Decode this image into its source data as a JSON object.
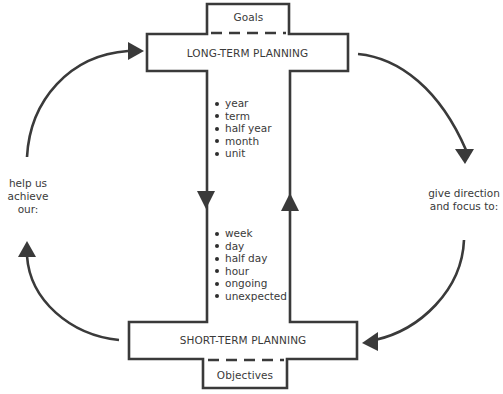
{
  "diagram": {
    "colors": {
      "stroke": "#3a3a3a",
      "text": "#3a3a3a",
      "background": "#ffffff"
    },
    "long_term": {
      "title": "LONG-TERM PLANNING",
      "tab_label": "Goals",
      "items": [
        "year",
        "term",
        "half year",
        "month",
        "unit"
      ]
    },
    "short_term": {
      "title": "SHORT-TERM PLANNING",
      "tab_label": "Objectives",
      "items": [
        "week",
        "day",
        "half day",
        "hour",
        "ongoing",
        "unexpected"
      ]
    },
    "left_label": [
      "help us",
      "achieve",
      "our:"
    ],
    "right_label": [
      "give direction",
      "and focus to:"
    ],
    "arrows": [
      {
        "from": "long-term-planning",
        "to": "short-term-planning",
        "path": "center-left",
        "direction": "down"
      },
      {
        "from": "short-term-planning",
        "to": "long-term-planning",
        "path": "center-right",
        "direction": "up"
      },
      {
        "from": "long-term-planning",
        "to": "short-term-planning",
        "path": "outer-right",
        "label": "give direction and focus to:"
      },
      {
        "from": "short-term-planning",
        "to": "long-term-planning",
        "path": "outer-left",
        "label": "help us achieve our:"
      }
    ]
  }
}
